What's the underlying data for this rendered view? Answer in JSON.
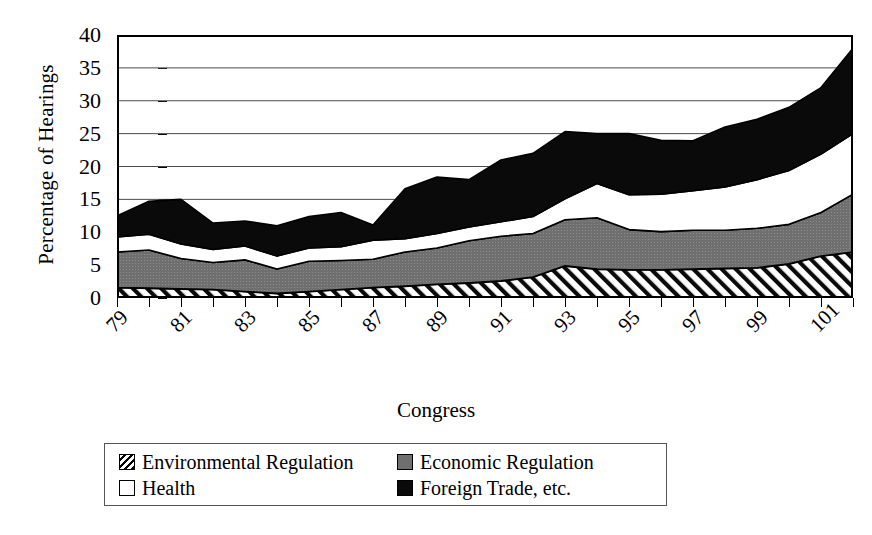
{
  "chart_data": {
    "type": "area",
    "stacked": true,
    "title": "",
    "xlabel": "Congress",
    "ylabel": "Percentage of Hearings",
    "ylim": [
      0,
      40
    ],
    "ytick_values": [
      0,
      5,
      10,
      15,
      20,
      25,
      30,
      35,
      40
    ],
    "grid": "horizontal",
    "legend_position": "bottom",
    "x": [
      79,
      80,
      81,
      82,
      83,
      84,
      85,
      86,
      87,
      88,
      89,
      90,
      91,
      92,
      93,
      94,
      95,
      96,
      97,
      98,
      99,
      100,
      101,
      102
    ],
    "xtick_labels": [
      "79",
      "81",
      "83",
      "85",
      "87",
      "89",
      "91",
      "93",
      "95",
      "97",
      "99",
      "101"
    ],
    "xtick_values": [
      79,
      81,
      83,
      85,
      87,
      89,
      91,
      93,
      95,
      97,
      99,
      101
    ],
    "series": [
      {
        "name": "Environmental Regulation",
        "fill": "hatch",
        "color": "#ffffff",
        "values": [
          1.6,
          1.5,
          1.4,
          1.3,
          1.0,
          0.7,
          1.0,
          1.3,
          1.6,
          1.8,
          2.1,
          2.3,
          2.6,
          3.2,
          4.9,
          4.4,
          4.3,
          4.3,
          4.4,
          4.5,
          4.6,
          5.2,
          6.4,
          7.0
        ]
      },
      {
        "name": "Economic Regulation",
        "fill": "solid",
        "color": "#6f6f6f",
        "values": [
          5.4,
          5.8,
          4.6,
          4.1,
          4.8,
          3.7,
          4.6,
          4.4,
          4.3,
          5.2,
          5.5,
          6.4,
          6.8,
          6.6,
          7.0,
          7.8,
          6.1,
          5.8,
          5.9,
          5.8,
          6.0,
          6.0,
          6.6,
          8.8
        ]
      },
      {
        "name": "Health",
        "fill": "solid",
        "color": "#ffffff",
        "values": [
          2.3,
          2.4,
          2.2,
          2.0,
          2.1,
          2.0,
          2.0,
          2.1,
          2.9,
          2.0,
          2.2,
          2.1,
          2.2,
          2.6,
          3.2,
          5.2,
          5.3,
          5.7,
          6.0,
          6.6,
          7.4,
          8.2,
          8.9,
          9.2
        ]
      },
      {
        "name": "Foreign Trade, etc.",
        "fill": "solid",
        "color": "#0a0a0a",
        "values": [
          3.2,
          5.0,
          6.8,
          4.0,
          3.8,
          4.6,
          4.8,
          5.2,
          2.3,
          7.6,
          8.6,
          7.2,
          9.4,
          9.6,
          10.2,
          7.6,
          9.3,
          8.2,
          7.6,
          9.1,
          9.2,
          9.6,
          10.1,
          13.0
        ]
      }
    ],
    "series_totals": [
      12.5,
      14.7,
      15.0,
      11.4,
      11.7,
      11.0,
      12.4,
      13.0,
      11.1,
      16.6,
      18.4,
      18.0,
      21.0,
      22.0,
      25.3,
      25.0,
      25.0,
      24.0,
      23.9,
      26.0,
      27.2,
      29.0,
      32.0,
      38.0
    ]
  },
  "legend": {
    "items": [
      {
        "label": "Environmental Regulation",
        "swatch": "hatch-swatch"
      },
      {
        "label": "Economic Regulation",
        "swatch": "gray-swatch"
      },
      {
        "label": "Health",
        "swatch": "white-swatch"
      },
      {
        "label": "Foreign Trade, etc.",
        "swatch": "black-swatch"
      }
    ]
  }
}
